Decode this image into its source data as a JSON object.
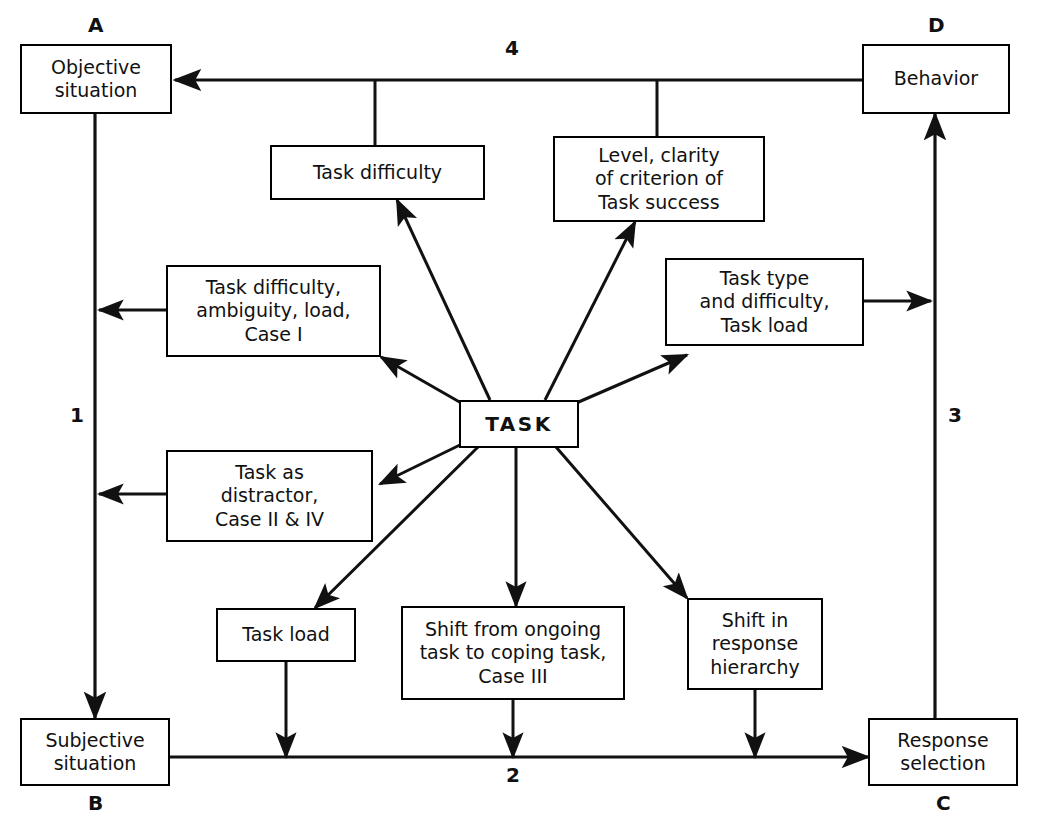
{
  "diagram": {
    "center_node": {
      "label": "TASK"
    },
    "corner_nodes": [
      {
        "tag": "A",
        "label": "Objective\nsituation"
      },
      {
        "tag": "B",
        "label": "Subjective\nsituation"
      },
      {
        "tag": "C",
        "label": "Response\nselection"
      },
      {
        "tag": "D",
        "label": "Behavior"
      }
    ],
    "mediator_nodes": [
      {
        "label": "Task difficulty"
      },
      {
        "label": "Level, clarity\nof criterion of\nTask success"
      },
      {
        "label": "Task difficulty,\nambiguity, load,\nCase I"
      },
      {
        "label": "Task type\nand difficulty,\nTask load"
      },
      {
        "label": "Task as\ndistractor,\nCase II & IV"
      },
      {
        "label": "Task load"
      },
      {
        "label": "Shift from ongoing\ntask to coping task,\nCase III"
      },
      {
        "label": "Shift in\nresponse\nhierarchy"
      }
    ],
    "edge_numbers": [
      {
        "value": "1"
      },
      {
        "value": "2"
      },
      {
        "value": "3"
      },
      {
        "value": "4"
      }
    ],
    "colors": {
      "line": "#111111",
      "box_border": "#000000",
      "background": "#ffffff"
    }
  }
}
